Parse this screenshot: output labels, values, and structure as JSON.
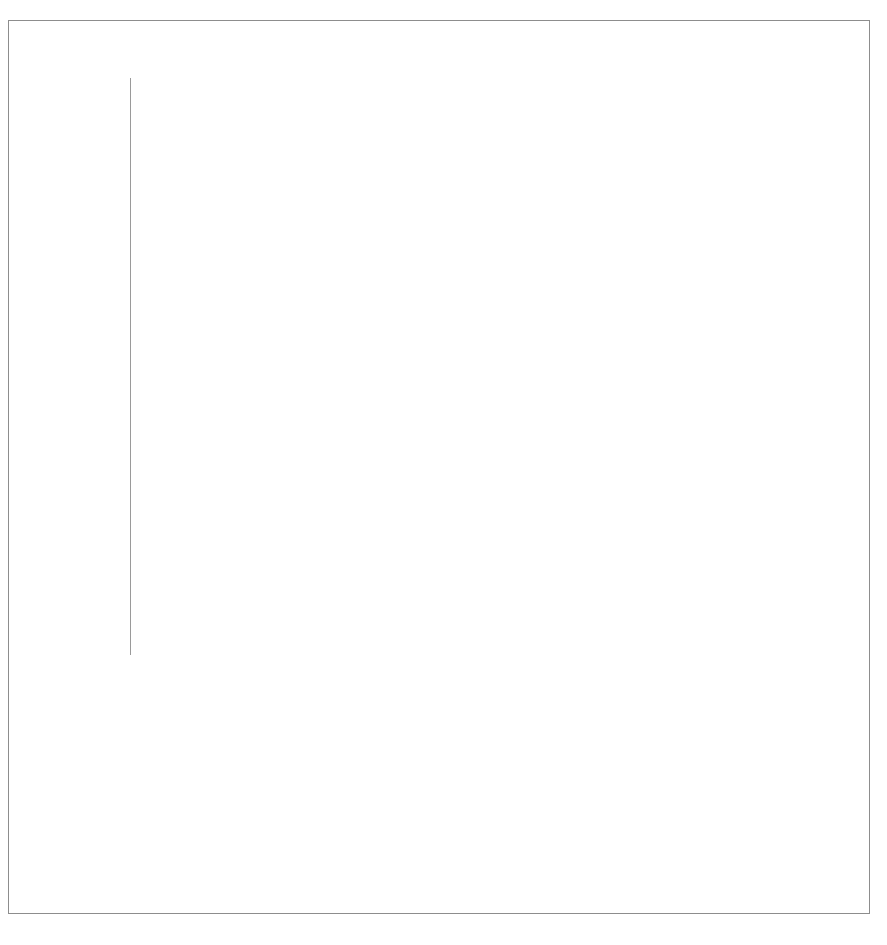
{
  "chart_data": {
    "type": "bar",
    "title": "",
    "xlabel": "",
    "ylabel": "Millions of 2016 Dollars",
    "ylim": [
      0,
      1000
    ],
    "ytick_labels": [
      "$0",
      "$100",
      "$200",
      "$300",
      "$400",
      "$500",
      "$600",
      "$700",
      "$800",
      "$900",
      "$1,000"
    ],
    "ytick_values": [
      0,
      100,
      200,
      300,
      400,
      500,
      600,
      700,
      800,
      900,
      1000
    ],
    "grid": true,
    "stacked": true,
    "legend_position": "bottom",
    "categories": [
      "2000",
      "2002",
      "2004",
      "2006",
      "2008",
      "2010",
      "2012",
      "2014",
      "2016"
    ],
    "subcategories": [
      "D",
      "R"
    ],
    "series": [
      {
        "name": "Contributions from Individuals",
        "color": "#6e6e6e",
        "pattern": "solid-gray",
        "values": {
          "D": [
            205,
            125,
            565,
            348,
            375,
            405,
            378,
            428,
            370
          ],
          "R": [
            412,
            365,
            710,
            466,
            487,
            355,
            382,
            338,
            297
          ]
        }
      },
      {
        "name": "Contributions from Federal Candidates",
        "color": "#111111",
        "pattern": "diagonal-hatch",
        "values": {
          "D": [
            7,
            13,
            105,
            57,
            80,
            62,
            34,
            34,
            38
          ],
          "R": [
            93,
            13,
            80,
            47,
            33,
            33,
            45,
            40,
            36
          ]
        }
      },
      {
        "name": "Contributions from PACs",
        "color": "#000000",
        "pattern": "solid-black",
        "values": {
          "D": [
            16,
            12,
            20,
            20,
            20,
            23,
            20,
            26,
            19
          ],
          "R": [
            23,
            12,
            22,
            32,
            20,
            22,
            28,
            40,
            22
          ]
        }
      },
      {
        "name": "Transfers from Affiliated Party Committees",
        "color": "#cacaca",
        "pattern": "solid-light-gray",
        "values": {
          "D": [
            14,
            12,
            13,
            7,
            125,
            30,
            152,
            17,
            225
          ],
          "R": [
            35,
            10,
            6,
            22,
            150,
            33,
            198,
            34,
            150
          ]
        }
      },
      {
        "name": "Soft Money Contributions",
        "color": "#ffffff",
        "pattern": "horizontal-hatch",
        "values": {
          "D": [
            366,
            360,
            0,
            0,
            0,
            0,
            0,
            0,
            0
          ],
          "R": [
            349,
            367,
            0,
            0,
            0,
            0,
            0,
            0,
            0
          ]
        }
      }
    ],
    "totals": {
      "D": [
        608,
        522,
        703,
        432,
        600,
        520,
        584,
        505,
        652
      ],
      "R": [
        912,
        767,
        818,
        567,
        690,
        443,
        653,
        452,
        505
      ]
    }
  },
  "axis": {
    "y_title": "Millions of 2016 Dollars"
  },
  "legend": {
    "items": [
      {
        "label": "Soft Money Contributions",
        "swatch": "sw-soft"
      },
      {
        "label": "Transfers from Affiliated Party Committees",
        "swatch": "sw-transfers"
      },
      {
        "label": "Contributions from PACs",
        "swatch": "sw-pacs"
      },
      {
        "label": "Contributions from Federal Candidates",
        "swatch": "sw-fedcand"
      },
      {
        "label": "Contributions from Individuals",
        "swatch": "sw-individuals"
      }
    ]
  }
}
